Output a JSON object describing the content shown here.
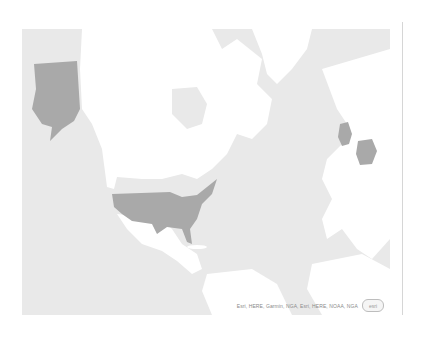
{
  "map": {
    "type": "choropleth",
    "colors": {
      "ocean": "#e9e9e9",
      "land": "#ffffff",
      "highlight": "#a9a9a9",
      "border": "#d6d6d6"
    },
    "highlighted_regions": [
      "United States",
      "Alaska",
      "United Kingdom",
      "Germany"
    ],
    "attribution": "Esri, HERE, Garmin, NGA, Esri, HERE, NOAA, NGA",
    "logo_text": "esri"
  }
}
